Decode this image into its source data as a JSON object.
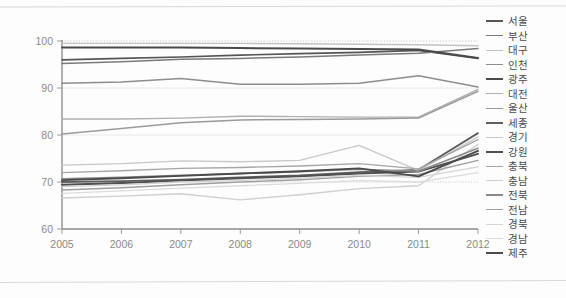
{
  "chart_data": {
    "type": "line",
    "title": "",
    "xlabel": "",
    "ylabel": "",
    "x": [
      2005,
      2006,
      2007,
      2008,
      2009,
      2010,
      2011,
      2012
    ],
    "xtick_labels": [
      "2005",
      "2006",
      "2007",
      "2008",
      "2009",
      "2010",
      "2011",
      "2012"
    ],
    "ytick_labels": [
      "60",
      "70",
      "80",
      "90",
      "100"
    ],
    "yticks": [
      60,
      70,
      80,
      90,
      100
    ],
    "ylim": [
      60,
      100
    ],
    "xlim": [
      2005,
      2012
    ],
    "grid": true,
    "legend_position": "right",
    "series": [
      {
        "name": "서울",
        "color": "#555555",
        "width": 1.7,
        "values": [
          96.0,
          96.3,
          96.6,
          97.0,
          97.3,
          97.6,
          98.0,
          96.3
        ]
      },
      {
        "name": "부산",
        "color": "#7a7a7a",
        "width": 1.5,
        "values": [
          95.2,
          95.6,
          96.1,
          96.3,
          96.6,
          97.0,
          97.4,
          98.4
        ]
      },
      {
        "name": "대구",
        "color": "#c2c2c2",
        "width": 1.4,
        "values": [
          99.5,
          99.5,
          99.5,
          99.5,
          99.4,
          99.3,
          99.2,
          99.0
        ]
      },
      {
        "name": "인천",
        "color": "#8d8d8d",
        "width": 1.5,
        "values": [
          91.0,
          91.3,
          92.0,
          90.8,
          90.8,
          91.0,
          92.6,
          90.2
        ]
      },
      {
        "name": "광주",
        "color": "#4a4a4a",
        "width": 2.0,
        "values": [
          98.6,
          98.6,
          98.6,
          98.5,
          98.4,
          98.3,
          98.2,
          96.4
        ]
      },
      {
        "name": "대전",
        "color": "#b0b0b0",
        "width": 1.4,
        "values": [
          83.4,
          83.4,
          83.6,
          84.0,
          83.9,
          83.8,
          83.8,
          89.7
        ]
      },
      {
        "name": "울산",
        "color": "#9a9a9a",
        "width": 1.5,
        "values": [
          80.2,
          81.4,
          82.6,
          83.2,
          83.3,
          83.4,
          83.6,
          89.3
        ]
      },
      {
        "name": "세종",
        "color": "#5f5f5f",
        "width": 1.8,
        "values": [
          70.0,
          70.2,
          70.5,
          71.0,
          71.4,
          72.1,
          72.6,
          80.4
        ]
      },
      {
        "name": "경기",
        "color": "#c8c8c8",
        "width": 1.4,
        "values": [
          73.6,
          73.9,
          74.5,
          74.3,
          74.6,
          77.8,
          72.4,
          79.6
        ]
      },
      {
        "name": "강원",
        "color": "#4f4f4f",
        "width": 1.9,
        "values": [
          69.4,
          69.8,
          70.3,
          70.8,
          71.2,
          71.8,
          72.2,
          76.0
        ]
      },
      {
        "name": "충북",
        "color": "#a6a6a6",
        "width": 1.4,
        "values": [
          72.0,
          72.4,
          72.9,
          73.1,
          73.4,
          73.9,
          72.8,
          79.0
        ]
      },
      {
        "name": "충남",
        "color": "#cfcfcf",
        "width": 1.4,
        "values": [
          66.6,
          67.0,
          67.5,
          66.2,
          67.3,
          68.6,
          69.2,
          78.0
        ]
      },
      {
        "name": "전북",
        "color": "#8a8a8a",
        "width": 1.6,
        "values": [
          70.7,
          71.0,
          71.4,
          71.8,
          72.2,
          72.7,
          72.3,
          77.2
        ]
      },
      {
        "name": "전남",
        "color": "#9f9f9f",
        "width": 1.5,
        "values": [
          68.3,
          68.8,
          69.4,
          70.0,
          70.5,
          71.2,
          71.6,
          74.6
        ]
      },
      {
        "name": "경북",
        "color": "#d4d4d4",
        "width": 1.3,
        "values": [
          69.0,
          69.4,
          70.0,
          70.3,
          70.8,
          71.4,
          71.0,
          73.2
        ]
      },
      {
        "name": "경남",
        "color": "#dcdcdc",
        "width": 1.3,
        "values": [
          67.6,
          68.1,
          68.7,
          69.2,
          69.7,
          70.3,
          70.0,
          72.0
        ]
      },
      {
        "name": "제주",
        "color": "#4a4a4a",
        "width": 1.9,
        "values": [
          70.4,
          70.8,
          71.3,
          71.8,
          72.3,
          72.9,
          71.2,
          76.6
        ]
      }
    ]
  },
  "legend": {
    "items": [
      {
        "label": "서울"
      },
      {
        "label": "부산"
      },
      {
        "label": "대구"
      },
      {
        "label": "인천"
      },
      {
        "label": "광주"
      },
      {
        "label": "대전"
      },
      {
        "label": "울산"
      },
      {
        "label": "세종"
      },
      {
        "label": "경기"
      },
      {
        "label": "강원"
      },
      {
        "label": "충북"
      },
      {
        "label": "충남"
      },
      {
        "label": "전북"
      },
      {
        "label": "전남"
      },
      {
        "label": "경북"
      },
      {
        "label": "경남"
      },
      {
        "label": "제주"
      }
    ]
  }
}
